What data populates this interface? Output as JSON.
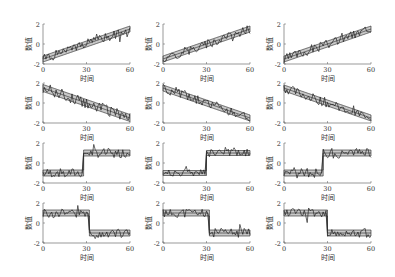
{
  "chart_data": {
    "type": "line",
    "layout": {
      "rows": 4,
      "cols": 3,
      "grid": false,
      "legend": null
    },
    "axis_common": {
      "xlabel": "时间",
      "ylabel": "数值",
      "xlim": [
        0,
        60
      ],
      "ylim": [
        -2,
        2
      ],
      "xticks": [
        0,
        30,
        60
      ],
      "yticks": [
        -2,
        0,
        2
      ]
    },
    "style": {
      "band_fill": "#c8c8c8",
      "line_color": "#222222",
      "axis_color": "#555555"
    },
    "panels": [
      {
        "row": 0,
        "col": 0,
        "pattern": "increasing",
        "start": -1.5,
        "end": 1.5,
        "band_width": 0.6,
        "seed": 1
      },
      {
        "row": 0,
        "col": 1,
        "pattern": "increasing",
        "start": -1.5,
        "end": 1.5,
        "band_width": 0.6,
        "seed": 2
      },
      {
        "row": 0,
        "col": 2,
        "pattern": "increasing",
        "start": -1.5,
        "end": 1.5,
        "band_width": 0.6,
        "seed": 3
      },
      {
        "row": 1,
        "col": 0,
        "pattern": "decreasing",
        "start": 1.5,
        "end": -1.5,
        "band_width": 0.7,
        "seed": 4
      },
      {
        "row": 1,
        "col": 1,
        "pattern": "decreasing",
        "start": 1.5,
        "end": -1.5,
        "band_width": 0.6,
        "seed": 5
      },
      {
        "row": 1,
        "col": 2,
        "pattern": "decreasing",
        "start": 1.5,
        "end": -1.5,
        "band_width": 0.6,
        "seed": 6
      },
      {
        "row": 2,
        "col": 0,
        "pattern": "step_up",
        "low": -1.0,
        "high": 1.0,
        "step_at": 28,
        "band_width": 0.6,
        "seed": 7
      },
      {
        "row": 2,
        "col": 1,
        "pattern": "step_up",
        "low": -1.0,
        "high": 1.0,
        "step_at": 30,
        "band_width": 0.5,
        "seed": 8
      },
      {
        "row": 2,
        "col": 2,
        "pattern": "step_up",
        "low": -1.0,
        "high": 1.0,
        "step_at": 27,
        "band_width": 0.6,
        "seed": 9
      },
      {
        "row": 3,
        "col": 0,
        "pattern": "step_down",
        "high": 1.0,
        "low": -1.0,
        "step_at": 32,
        "band_width": 0.6,
        "seed": 10
      },
      {
        "row": 3,
        "col": 1,
        "pattern": "step_down",
        "high": 1.0,
        "low": -1.0,
        "step_at": 32,
        "band_width": 0.6,
        "seed": 11
      },
      {
        "row": 3,
        "col": 2,
        "pattern": "step_down",
        "high": 1.0,
        "low": -1.0,
        "step_at": 30,
        "band_width": 0.6,
        "seed": 12
      }
    ]
  },
  "geometry": {
    "col_left": [
      43,
      163,
      284
    ],
    "plot_width": 87,
    "row_top": [
      24,
      83,
      143,
      203
    ],
    "plot_height": 40
  }
}
